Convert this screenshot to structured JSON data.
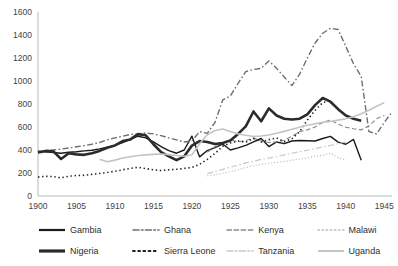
{
  "chart_data": {
    "type": "line",
    "title": "",
    "subtitle": "",
    "xlabel": "",
    "ylabel": "",
    "xlim": [
      1900,
      1946
    ],
    "ylim": [
      0,
      1600
    ],
    "grid": false,
    "legend_position": "bottom",
    "xticks": [
      1900,
      1905,
      1910,
      1915,
      1920,
      1925,
      1930,
      1935,
      1940,
      1945
    ],
    "yticks": [
      0,
      200,
      400,
      600,
      800,
      1000,
      1200,
      1400,
      1600
    ],
    "series": [
      {
        "name": "Gambia",
        "style": "solid",
        "color": "#1a1a1a",
        "width": 1.4,
        "x": [
          1900,
          1901,
          1902,
          1903,
          1904,
          1905,
          1906,
          1907,
          1908,
          1909,
          1910,
          1911,
          1912,
          1913,
          1914,
          1915,
          1916,
          1917,
          1918,
          1919,
          1920,
          1921,
          1922,
          1923,
          1924,
          1925,
          1926,
          1927,
          1928,
          1929,
          1930,
          1931,
          1932,
          1933,
          1934,
          1935,
          1936,
          1937,
          1938,
          1939,
          1940,
          1941,
          1942
        ],
        "y": [
          390,
          385,
          378,
          372,
          380,
          385,
          392,
          398,
          410,
          425,
          440,
          465,
          492,
          520,
          505,
          470,
          430,
          395,
          372,
          400,
          520,
          340,
          395,
          420,
          452,
          400,
          418,
          440,
          470,
          500,
          430,
          470,
          455,
          478,
          482,
          480,
          478,
          500,
          518,
          468,
          450,
          492,
          310
        ]
      },
      {
        "name": "Ghana",
        "style": "dashdot",
        "color": "#6e6e6e",
        "width": 1.4,
        "x": [
          1900,
          1901,
          1902,
          1903,
          1904,
          1905,
          1906,
          1907,
          1908,
          1909,
          1910,
          1911,
          1912,
          1913,
          1914,
          1915,
          1916,
          1917,
          1918,
          1919,
          1920,
          1921,
          1922,
          1923,
          1924,
          1925,
          1926,
          1927,
          1928,
          1929,
          1930,
          1931,
          1932,
          1933,
          1934,
          1935,
          1936,
          1937,
          1938,
          1939,
          1940,
          1941,
          1942,
          1943,
          1944,
          1945,
          1946
        ],
        "y": [
          382,
          392,
          400,
          408,
          418,
          428,
          438,
          450,
          465,
          488,
          505,
          520,
          535,
          540,
          548,
          540,
          525,
          505,
          488,
          470,
          478,
          560,
          545,
          640,
          835,
          870,
          980,
          1082,
          1100,
          1110,
          1175,
          1110,
          1035,
          960,
          1060,
          1200,
          1330,
          1415,
          1458,
          1448,
          1300,
          1150,
          1040,
          560,
          540,
          640,
          730
        ]
      },
      {
        "name": "Kenya",
        "style": "dashed",
        "color": "#8a8a8a",
        "width": 1.2,
        "x": [
          1922,
          1923,
          1924,
          1925,
          1926,
          1927,
          1928,
          1929,
          1930,
          1931,
          1932,
          1933,
          1934,
          1935,
          1936,
          1937,
          1938,
          1939,
          1940,
          1941,
          1942,
          1943,
          1944,
          1945
        ],
        "y": [
          380,
          430,
          460,
          490,
          470,
          482,
          505,
          478,
          465,
          470,
          485,
          520,
          560,
          575,
          600,
          640,
          660,
          625,
          598,
          585,
          575,
          610,
          672,
          700
        ]
      },
      {
        "name": "Malawi",
        "style": "dotted",
        "color": "#bdbdbd",
        "width": 1.2,
        "x": [
          1922,
          1923,
          1924,
          1925,
          1926,
          1927,
          1928,
          1929,
          1930,
          1931,
          1932,
          1933,
          1934,
          1935,
          1936,
          1937,
          1938,
          1939,
          1940
        ],
        "y": [
          175,
          185,
          198,
          212,
          228,
          248,
          262,
          275,
          285,
          292,
          300,
          312,
          322,
          332,
          345,
          355,
          372,
          332,
          315
        ]
      },
      {
        "name": "Nigeria",
        "style": "solid",
        "color": "#2b2b2b",
        "width": 2.6,
        "x": [
          1900,
          1901,
          1902,
          1903,
          1904,
          1905,
          1906,
          1907,
          1908,
          1909,
          1910,
          1911,
          1912,
          1913,
          1914,
          1915,
          1916,
          1917,
          1918,
          1919,
          1920,
          1921,
          1922,
          1923,
          1924,
          1925,
          1926,
          1927,
          1928,
          1929,
          1930,
          1931,
          1932,
          1933,
          1934,
          1935,
          1936,
          1937,
          1938,
          1939,
          1940,
          1941,
          1942
        ],
        "y": [
          378,
          392,
          388,
          322,
          372,
          362,
          358,
          372,
          392,
          420,
          440,
          478,
          492,
          538,
          528,
          450,
          382,
          345,
          312,
          345,
          438,
          478,
          470,
          452,
          460,
          482,
          540,
          605,
          735,
          650,
          762,
          700,
          672,
          665,
          672,
          710,
          790,
          852,
          820,
          755,
          700,
          672,
          655
        ]
      },
      {
        "name": "Sierra Leone",
        "style": "dotted",
        "color": "#222222",
        "width": 1.6,
        "x": [
          1900,
          1901,
          1902,
          1903,
          1904,
          1905,
          1906,
          1907,
          1908,
          1909,
          1910,
          1911,
          1912,
          1913,
          1914,
          1915,
          1916,
          1917,
          1918,
          1919,
          1920,
          1921,
          1922,
          1923,
          1924,
          1925,
          1926,
          1927,
          1928,
          1929,
          1930,
          1931,
          1932,
          1933,
          1934,
          1935,
          1936,
          1937,
          1938
        ],
        "y": [
          165,
          172,
          168,
          158,
          172,
          178,
          180,
          188,
          196,
          205,
          215,
          228,
          240,
          250,
          238,
          228,
          222,
          228,
          232,
          240,
          248,
          275,
          318,
          370,
          432,
          462,
          478,
          468,
          500,
          470,
          490,
          505,
          472,
          498,
          560,
          660,
          745,
          812,
          830
        ]
      },
      {
        "name": "Tanzania",
        "style": "dashdot",
        "color": "#c9c9c9",
        "width": 1.2,
        "x": [
          1922,
          1923,
          1924,
          1925,
          1926,
          1927,
          1928,
          1929,
          1930,
          1931,
          1932,
          1933,
          1934,
          1935,
          1936,
          1937,
          1938,
          1939,
          1940
        ],
        "y": [
          195,
          212,
          232,
          250,
          268,
          288,
          302,
          318,
          330,
          342,
          358,
          372,
          385,
          398,
          412,
          428,
          440,
          455,
          470
        ]
      },
      {
        "name": "Uganda",
        "style": "solid",
        "color": "#c4c4c4",
        "width": 1.6,
        "x": [
          1908,
          1909,
          1910,
          1911,
          1912,
          1913,
          1914,
          1915,
          1916,
          1917,
          1918,
          1919,
          1920,
          1921,
          1922,
          1923,
          1924,
          1925,
          1926,
          1927,
          1928,
          1929,
          1930,
          1931,
          1932,
          1933,
          1934,
          1935,
          1936,
          1937,
          1938,
          1939,
          1940,
          1941,
          1942,
          1943,
          1944,
          1945
        ],
        "y": [
          320,
          298,
          312,
          330,
          342,
          352,
          358,
          362,
          365,
          360,
          352,
          345,
          358,
          455,
          532,
          570,
          582,
          560,
          540,
          528,
          518,
          522,
          530,
          545,
          562,
          580,
          598,
          615,
          628,
          640,
          648,
          660,
          672,
          690,
          715,
          745,
          780,
          812
        ]
      }
    ]
  },
  "legend": {
    "items": [
      {
        "label": "Gambia",
        "style": "solid",
        "color": "#1a1a1a",
        "width": 2.2
      },
      {
        "label": "Ghana",
        "style": "dashdot",
        "color": "#6e6e6e",
        "width": 1.6
      },
      {
        "label": "Kenya",
        "style": "dashed",
        "color": "#8a8a8a",
        "width": 1.4
      },
      {
        "label": "Malawi",
        "style": "dotted",
        "color": "#bdbdbd",
        "width": 1.6
      },
      {
        "label": "Nigeria",
        "style": "solid",
        "color": "#2b2b2b",
        "width": 3.2
      },
      {
        "label": "Sierra Leone",
        "style": "dotted",
        "color": "#222222",
        "width": 2
      },
      {
        "label": "Tanzania",
        "style": "dashdot",
        "color": "#c9c9c9",
        "width": 1.6
      },
      {
        "label": "Uganda",
        "style": "solid",
        "color": "#c4c4c4",
        "width": 2
      }
    ]
  }
}
